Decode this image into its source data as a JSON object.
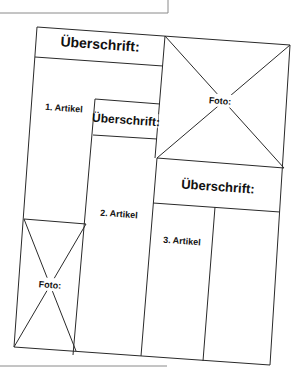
{
  "diagram": {
    "blocks": {
      "headline_1": "Überschrift:",
      "headline_2": "Überschrift:",
      "headline_3": "Überschrift:",
      "article_1": "1. Artikel",
      "article_2": "2. Artikel",
      "article_3": "3. Artikel",
      "photo_1": "Foto:",
      "photo_2": "Foto:"
    }
  }
}
